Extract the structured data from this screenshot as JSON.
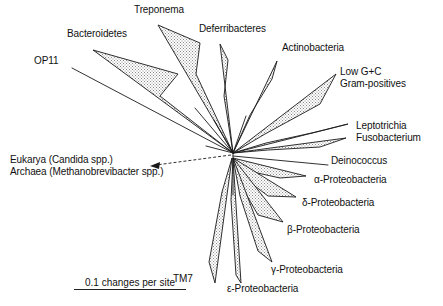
{
  "figure": {
    "type": "unrooted-phylogenetic-tree",
    "width": 443,
    "height": 306,
    "background": "#ffffff",
    "line_color": "#1a1a1a",
    "wedge_fill": "#d8d8d8",
    "root_node": {
      "x": 233,
      "y": 153
    }
  },
  "scale_bar": {
    "label": "0.1 changes per site",
    "x": 74,
    "y": 281,
    "bar_width": 112
  },
  "taxa": [
    {
      "id": "op11",
      "label": "OP11",
      "label_x": 34,
      "label_y": 60,
      "shape": "line",
      "tip_x": 72,
      "tip_y": 68
    },
    {
      "id": "bacteroidetes",
      "label": "Bacteroidetes",
      "label_x": 67,
      "label_y": 33,
      "shape": "wedge",
      "tip_x": 93,
      "tip_y": 50,
      "mid_x": 162,
      "mid_y": 81
    },
    {
      "id": "treponema",
      "label": "Treponema",
      "label_x": 134,
      "label_y": 7,
      "shape": "wedge",
      "tip_x": 158,
      "tip_y": 25,
      "mid_x": 199,
      "mid_y": 48
    },
    {
      "id": "deferribacteres",
      "label": "Deferribacteres",
      "label_x": 200,
      "label_y": 27,
      "shape": "wedge",
      "tip_x": 220,
      "tip_y": 44,
      "mid_x": 222,
      "mid_y": 76
    },
    {
      "id": "actinobacteria",
      "label": "Actinobacteria",
      "label_x": 283,
      "label_y": 45,
      "shape": "wedge",
      "tip_x": 277,
      "tip_y": 61,
      "mid_x": 263,
      "mid_y": 86
    },
    {
      "id": "low-gc-gram-positives",
      "label_line1": "Low G+C",
      "label_line2": "Gram-positives",
      "label_x": 341,
      "label_y": 71,
      "shape": "wedge",
      "tip_x": 336,
      "tip_y": 74,
      "mid_x": 300,
      "mid_y": 108
    },
    {
      "id": "leptotrichia",
      "label": "Leptotrichia",
      "label_x": 357,
      "label_y": 125,
      "shape": "wedge",
      "tip_x": 348,
      "tip_y": 124,
      "mid_x": 300,
      "mid_y": 135
    },
    {
      "id": "fusobacterium",
      "label": "Fusobacterium",
      "label_x": 357,
      "label_y": 136,
      "shape": "wedge",
      "tip_x": 346,
      "tip_y": 138,
      "mid_x": 300,
      "mid_y": 146
    },
    {
      "id": "deinococcus",
      "label": "Deinococcus",
      "label_x": 332,
      "label_y": 159,
      "shape": "line",
      "tip_x": 328,
      "tip_y": 165
    },
    {
      "id": "alpha-proteobacteria",
      "label": "α-Proteobacteria",
      "label_x": 315,
      "label_y": 178,
      "shape": "wedge",
      "tip_x": 306,
      "tip_y": 176,
      "mid_x": 275,
      "mid_y": 172
    },
    {
      "id": "delta-proteobacteria",
      "label": "δ-Proteobacteria",
      "label_x": 303,
      "label_y": 201,
      "shape": "wedge",
      "tip_x": 296,
      "tip_y": 197,
      "mid_x": 268,
      "mid_y": 187
    },
    {
      "id": "beta-proteobacteria",
      "label": "β-Proteobacteria",
      "label_x": 288,
      "label_y": 228,
      "shape": "wedge",
      "tip_x": 283,
      "tip_y": 222,
      "mid_x": 259,
      "mid_y": 203
    },
    {
      "id": "gamma-proteobacteria",
      "label": "γ-Proteobacteria",
      "label_x": 272,
      "label_y": 268,
      "shape": "wedge",
      "tip_x": 272,
      "tip_y": 262,
      "mid_x": 252,
      "mid_y": 222
    },
    {
      "id": "epsilon-proteobacteria",
      "label": "ε-Proteobacteria",
      "label_x": 228,
      "label_y": 286,
      "shape": "wedge",
      "tip_x": 241,
      "tip_y": 283,
      "mid_x": 238,
      "mid_y": 230
    },
    {
      "id": "tm7",
      "label": "TM7",
      "label_x": 174,
      "label_y": 277,
      "shape": "wedge",
      "tip_x": 215,
      "tip_y": 283,
      "mid_x": 222,
      "mid_y": 225
    }
  ],
  "outgroup_arrow": {
    "label_line1": "Eukarya (Candida spp.)",
    "label_line2": "Archaea (Methanobrevibacter spp.)",
    "label_x": 10,
    "label_y": 158,
    "arrow_tip_x": 152,
    "arrow_tip_y": 166,
    "arrow_tail_x": 231,
    "arrow_tail_y": 155
  }
}
